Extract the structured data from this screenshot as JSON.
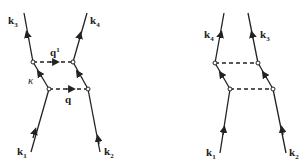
{
  "diagrams": [
    {
      "name": "direct",
      "labels": {
        "top_left": "k",
        "top_left_sub": "3",
        "top_right": "k",
        "top_right_sub": "4",
        "bottom_left": "k",
        "bottom_left_sub": "1",
        "bottom_right": "k",
        "bottom_right_sub": "2",
        "upper_exchange": "q",
        "upper_exchange_sup": "1",
        "lower_exchange": "q",
        "internal": "κ"
      }
    },
    {
      "name": "crossed",
      "labels": {
        "top_left": "k",
        "top_left_sub": "4",
        "top_right": "k",
        "top_right_sub": "3",
        "bottom_left": "k",
        "bottom_left_sub": "1",
        "bottom_right": "k",
        "bottom_right_sub": "2"
      }
    }
  ]
}
